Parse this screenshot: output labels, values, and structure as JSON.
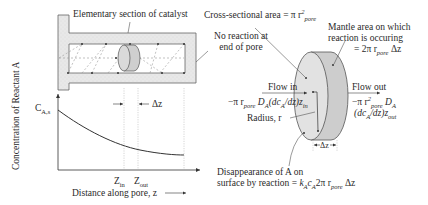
{
  "pore_diagram": {
    "title_label": "Elementary section of catalyst",
    "end_label_line1": "No reaction at",
    "end_label_line2": "end of pore",
    "colors": {
      "wall_fill": "#e6e6e6",
      "wall_stroke": "#555555",
      "disk_fill": "#cfcfcf",
      "dash": "#8a8a8a"
    }
  },
  "concentration_plot": {
    "ylabel": "Concentration of Reactant A",
    "y_start_label_main": "C",
    "y_start_label_sub": "A,s",
    "delta_z_label": "Δz",
    "z_in_main": "Z",
    "z_in_sub": "in",
    "z_out_main": "Z",
    "z_out_sub": "out",
    "xlabel": "Distance along pore, z"
  },
  "element_detail": {
    "cross_section_text": "Cross-sectional area = π r",
    "cross_section_sup": "2",
    "cross_section_sub": "pore",
    "mantle_line1": "Mantle area on which",
    "mantle_line2": "reaction is occuring",
    "mantle_line3_prefix": "= 2π r",
    "mantle_line3_sub": "pore",
    "mantle_line3_suffix": " Δz",
    "flow_in": "Flow in",
    "flow_out": "Flow out",
    "flow_in_expr_a": "−π r",
    "flow_in_expr_sub1": "pore",
    "flow_in_expr_b": " D",
    "flow_in_expr_sub2": "A",
    "flow_in_expr_c": "(dc",
    "flow_in_expr_sub3": "A",
    "flow_in_expr_d": "/dz)z",
    "flow_in_expr_sub4": "in",
    "flow_out_expr_a": "−π r",
    "flow_out_expr_sup": "2",
    "flow_out_expr_sub1": "pore",
    "flow_out_expr_b": " D",
    "flow_out_expr_sub2": "A",
    "flow_out_expr_c": "(dc",
    "flow_out_expr_sub3": "A",
    "flow_out_expr_d": "/dz)z",
    "flow_out_expr_sub4": "out",
    "radius_label": "Radius, r",
    "delta_z_label": "Δz",
    "disappearance_line1": "Disappearance of A on",
    "disappearance_line2_prefix": "surface by reaction = ",
    "disappearance_k": "k",
    "disappearance_k_sub": "A",
    "disappearance_c": "c",
    "disappearance_c_sub": "A",
    "disappearance_mid": "2π r",
    "disappearance_r_sub": "pore",
    "disappearance_end": " Δz"
  }
}
